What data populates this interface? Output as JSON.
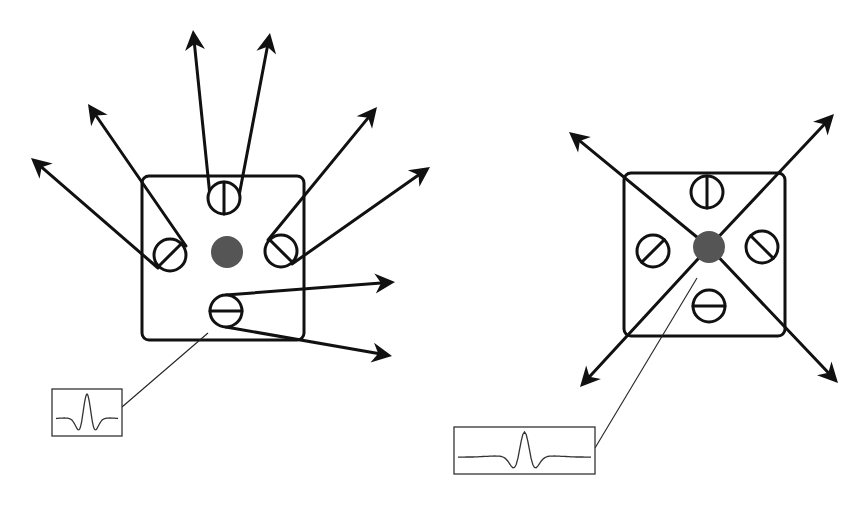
{
  "figure": {
    "colors": {
      "ink": "#111111",
      "dot": "#555555",
      "inset_line": "#333333",
      "background": "#ffffff"
    }
  },
  "left_diagram": {
    "box": {
      "x": 142,
      "y": 176,
      "w": 162,
      "h": 164,
      "r": 7
    },
    "center_dot": {
      "cx": 227,
      "cy": 252,
      "r": 16
    },
    "cells": [
      {
        "name": "top",
        "cx": 224,
        "cy": 198,
        "r": 16,
        "bar_angle": 90
      },
      {
        "name": "left",
        "cx": 170,
        "cy": 255,
        "r": 16,
        "bar_angle": 45
      },
      {
        "name": "right",
        "cx": 281,
        "cy": 251,
        "r": 16,
        "bar_angle": -45
      },
      {
        "name": "bottom",
        "cx": 226,
        "cy": 311,
        "r": 16,
        "bar_angle": 0
      }
    ],
    "arrows": [
      {
        "from": [
          210,
          196
        ],
        "to": [
          193,
          30
        ]
      },
      {
        "from": [
          239,
          196
        ],
        "to": [
          270,
          33
        ]
      },
      {
        "from": [
          158,
          268
        ],
        "to": [
          31,
          158
        ]
      },
      {
        "from": [
          186,
          246
        ],
        "to": [
          88,
          104
        ]
      },
      {
        "from": [
          268,
          240
        ],
        "to": [
          377,
          107
        ]
      },
      {
        "from": [
          292,
          264
        ],
        "to": [
          430,
          167
        ]
      },
      {
        "from": [
          226,
          295
        ],
        "to": [
          395,
          282
        ]
      },
      {
        "from": [
          226,
          327
        ],
        "to": [
          392,
          356
        ]
      }
    ],
    "pointer_line": {
      "from": [
        208,
        333
      ],
      "to": [
        122,
        407
      ]
    },
    "inset": {
      "x": 52,
      "y": 389,
      "w": 70,
      "h": 47,
      "waveform": "narrow-mexican-hat"
    }
  },
  "right_diagram": {
    "box": {
      "x": 624,
      "y": 173,
      "w": 161,
      "h": 163,
      "r": 7
    },
    "center_dot": {
      "cx": 709,
      "cy": 247,
      "r": 16
    },
    "cells": [
      {
        "name": "top",
        "cx": 707,
        "cy": 192,
        "r": 16,
        "bar_angle": 90
      },
      {
        "name": "left",
        "cx": 653,
        "cy": 251,
        "r": 16,
        "bar_angle": 45
      },
      {
        "name": "right",
        "cx": 762,
        "cy": 247,
        "r": 16,
        "bar_angle": -45
      },
      {
        "name": "bottom",
        "cx": 709,
        "cy": 306,
        "r": 16,
        "bar_angle": 0
      }
    ],
    "arrows": [
      {
        "from": [
          709,
          247
        ],
        "to": [
          569,
          132
        ]
      },
      {
        "from": [
          709,
          247
        ],
        "to": [
          834,
          114
        ]
      },
      {
        "from": [
          709,
          247
        ],
        "to": [
          580,
          387
        ]
      },
      {
        "from": [
          709,
          247
        ],
        "to": [
          838,
          383
        ]
      }
    ],
    "pointer_line": {
      "from": [
        697,
        278
      ],
      "to": [
        595,
        448
      ]
    },
    "inset": {
      "x": 454,
      "y": 427,
      "w": 141,
      "h": 47,
      "waveform": "wide-mexican-hat"
    }
  }
}
